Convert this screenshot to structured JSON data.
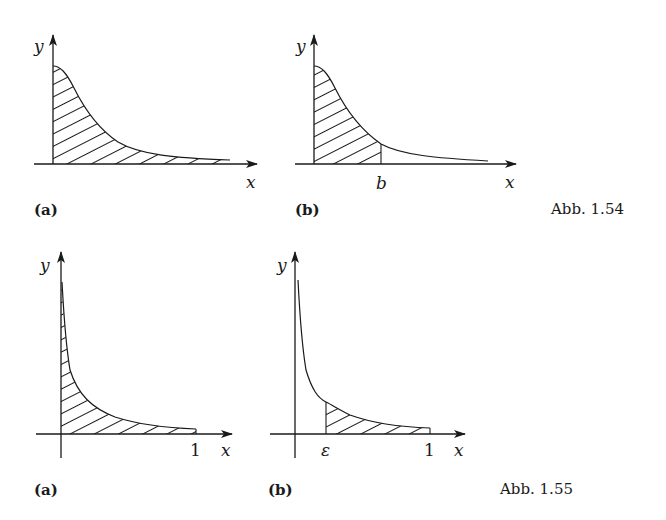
{
  "figures": [
    {
      "caption": "Abb. 1.54",
      "panels": [
        {
          "id": "a",
          "label": "(a)",
          "x_axis_label": "x",
          "y_axis_label": "y",
          "description": "Bell-shaped decaying curve, whole area under curve from 0 to infinity hatched",
          "shaded_region": "[0, ∞)"
        },
        {
          "id": "b",
          "label": "(b)",
          "x_axis_label": "x",
          "y_axis_label": "y",
          "tick_labels": [
            "b"
          ],
          "description": "Same curve, area hatched only from 0 to b",
          "shaded_region": "[0, b]"
        }
      ]
    },
    {
      "caption": "Abb. 1.55",
      "panels": [
        {
          "id": "a",
          "label": "(a)",
          "x_axis_label": "x",
          "y_axis_label": "y",
          "tick_labels": [
            "1"
          ],
          "description": "Hyperbola-like curve with vertical asymptote at x=0, area hatched from 0 to 1",
          "shaded_region": "(0, 1]"
        },
        {
          "id": "b",
          "label": "(b)",
          "x_axis_label": "x",
          "y_axis_label": "y",
          "tick_labels": [
            "ε",
            "1"
          ],
          "description": "Same curve, area hatched from ε to 1",
          "shaded_region": "[ε, 1]"
        }
      ]
    }
  ],
  "colors": {
    "ink": "#1a1a1a",
    "background": "#ffffff"
  }
}
